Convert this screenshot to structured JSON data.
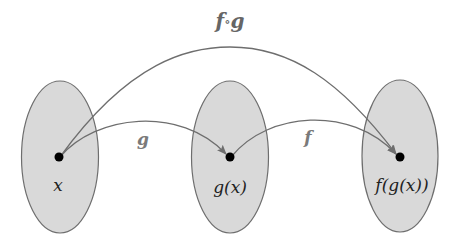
{
  "diagram": {
    "title_label": {
      "f": "f",
      "compose": "∘",
      "g": "g"
    },
    "sets": [
      {
        "id": "domain",
        "point_label": "x"
      },
      {
        "id": "middle",
        "point_label": "g(x)"
      },
      {
        "id": "codomain",
        "point_label": "f(g(x))"
      }
    ],
    "arrows": [
      {
        "from": "x",
        "to": "g(x)",
        "label": "g"
      },
      {
        "from": "g(x)",
        "to": "f(g(x))",
        "label": "f"
      },
      {
        "from": "x",
        "to": "f(g(x))",
        "label": "f∘g"
      }
    ],
    "colors": {
      "set_fill": "#d9d9d9",
      "set_stroke": "#6e6e6e",
      "arrow": "#6e6e6e",
      "point": "#000000"
    }
  }
}
